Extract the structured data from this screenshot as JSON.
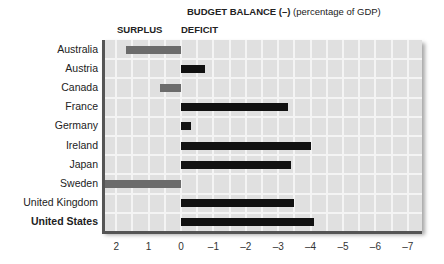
{
  "chart_data": {
    "type": "bar",
    "orientation": "horizontal",
    "title": "BUDGET BALANCE (–)",
    "title_suffix": "(percentage of GDP)",
    "left_header": "SURPLUS",
    "right_header": "DEFICIT",
    "categories": [
      "Australia",
      "Austria",
      "Canada",
      "France",
      "Germany",
      "Ireland",
      "Japan",
      "Sweden",
      "United Kingdom",
      "United States"
    ],
    "values": [
      1.7,
      -0.75,
      0.65,
      -3.3,
      -0.3,
      -4.0,
      -3.4,
      2.5,
      -3.5,
      -4.1
    ],
    "xlim": [
      2.5,
      -7.5
    ],
    "xticks": [
      2,
      1,
      0,
      -1,
      -2,
      -3,
      -4,
      -5,
      -6,
      -7
    ],
    "xtick_labels": [
      "2",
      "1",
      "0",
      "–1",
      "–2",
      "–3",
      "–4",
      "–5",
      "–6",
      "–7"
    ],
    "grid": true,
    "highlight_category": "United States",
    "colors": {
      "surplus": "#6b6b6b",
      "deficit": "#111111",
      "plot_bg": "#e0e0e0",
      "grid": "#f4f4f4"
    }
  }
}
